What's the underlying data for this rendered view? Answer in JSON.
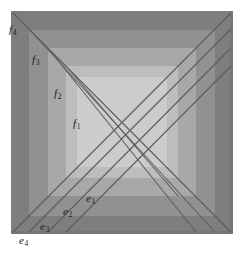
{
  "figure": {
    "name": "nested-squares-diagonal-diagram",
    "width": 241,
    "height": 253,
    "background": "#ffffff"
  },
  "bands": [
    {
      "id": "band-4",
      "name": "outer-band",
      "color": "#7e7e7e",
      "x": 11,
      "y": 11,
      "w": 222,
      "h": 223
    },
    {
      "id": "band-3",
      "name": "second-band",
      "color": "#919191",
      "x": 29,
      "y": 30,
      "w": 186,
      "h": 186
    },
    {
      "id": "band-2",
      "name": "third-band",
      "color": "#a8a8a8",
      "x": 48,
      "y": 48,
      "w": 148,
      "h": 148
    },
    {
      "id": "band-1",
      "name": "inner-band",
      "color": "#bdbdbd",
      "x": 66,
      "y": 66,
      "w": 112,
      "h": 112
    },
    {
      "id": "band-0",
      "name": "core-square",
      "color": "#cccccc",
      "x": 77,
      "y": 77,
      "w": 90,
      "h": 90
    }
  ],
  "band_edges": {
    "outer_rect": {
      "x": 11,
      "y": 11,
      "w": 222,
      "h": 223
    },
    "shadow_bottom": "#6f6f6f",
    "shadow_right": "#6f6f6f"
  },
  "line_color": "#5d5d5d",
  "line_width": 1.1,
  "lines": {
    "rising": [
      {
        "id": "e4",
        "name": "diagonal-e4",
        "x1": 13,
        "y1": 232,
        "x2": 231,
        "y2": 13
      },
      {
        "id": "e3",
        "name": "diagonal-e3",
        "x1": 29,
        "y1": 232,
        "x2": 231,
        "y2": 29
      },
      {
        "id": "e2",
        "name": "diagonal-e2",
        "x1": 48,
        "y1": 232,
        "x2": 231,
        "y2": 48
      },
      {
        "id": "e1",
        "name": "diagonal-e1",
        "x1": 66,
        "y1": 232,
        "x2": 231,
        "y2": 66
      }
    ],
    "falling": [
      {
        "id": "f4",
        "name": "diagonal-f4",
        "x1": 13,
        "y1": 13,
        "x2": 231,
        "y2": 232
      },
      {
        "id": "f3",
        "name": "diagonal-f3",
        "x1": 29,
        "y1": 29,
        "x2": 215,
        "y2": 232
      },
      {
        "id": "f2",
        "name": "diagonal-f2",
        "x1": 48,
        "y1": 48,
        "x2": 196,
        "y2": 232
      },
      {
        "id": "f1",
        "name": "diagonal-f1",
        "x1": 66,
        "y1": 66,
        "x2": 178,
        "y2": 196
      }
    ]
  },
  "labels": [
    {
      "id": "f4",
      "name": "label-f4",
      "base": "f",
      "sub": "4",
      "x": 9,
      "y": 30
    },
    {
      "id": "f3",
      "name": "label-f3",
      "base": "f",
      "sub": "3",
      "x": 32,
      "y": 60
    },
    {
      "id": "f2",
      "name": "label-f2",
      "base": "f",
      "sub": "2",
      "x": 54,
      "y": 94
    },
    {
      "id": "f1",
      "name": "label-f1",
      "base": "f",
      "sub": "1",
      "x": 73,
      "y": 124
    },
    {
      "id": "e1",
      "name": "label-e1",
      "base": "e",
      "sub": "1",
      "x": 86,
      "y": 199
    },
    {
      "id": "e2",
      "name": "label-e2",
      "base": "e",
      "sub": "2",
      "x": 63,
      "y": 212
    },
    {
      "id": "e3",
      "name": "label-e3",
      "base": "e",
      "sub": "3",
      "x": 40,
      "y": 227
    },
    {
      "id": "e4",
      "name": "label-e4",
      "base": "e",
      "sub": "4",
      "x": 19,
      "y": 241
    }
  ]
}
